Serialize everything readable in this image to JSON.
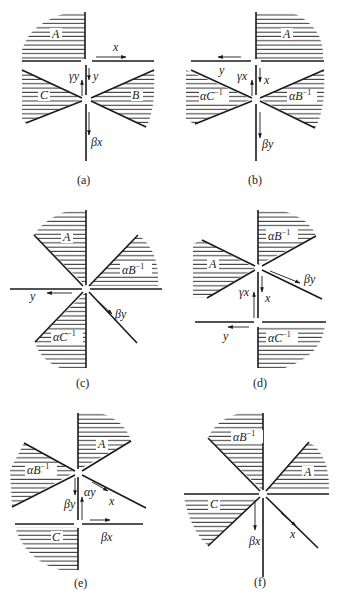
{
  "figure": {
    "panels": [
      {
        "id": "a",
        "caption": "(a)",
        "regions": [
          "A",
          "C",
          "B"
        ],
        "arrows": [
          "x",
          "y",
          "γy",
          "βx"
        ]
      },
      {
        "id": "b",
        "caption": "(b)",
        "regions": [
          "A",
          "αC⁻¹",
          "αB⁻¹"
        ],
        "arrows": [
          "y",
          "γx",
          "x",
          "βy"
        ]
      },
      {
        "id": "c",
        "caption": "(c)",
        "regions": [
          "A",
          "αB⁻¹",
          "αC⁻¹"
        ],
        "arrows": [
          "y",
          "βy"
        ]
      },
      {
        "id": "d",
        "caption": "(d)",
        "regions": [
          "αB⁻¹",
          "A",
          "αC⁻¹"
        ],
        "arrows": [
          "βy",
          "γx",
          "x",
          "y"
        ]
      },
      {
        "id": "e",
        "caption": "(e)",
        "regions": [
          "A",
          "αB⁻¹",
          "C"
        ],
        "arrows": [
          "βy",
          "αy",
          "x",
          "βx"
        ]
      },
      {
        "id": "f",
        "caption": "(f)",
        "regions": [
          "αB⁻¹",
          "A",
          "C"
        ],
        "arrows": [
          "βx",
          "x"
        ]
      }
    ]
  },
  "labels": {
    "a": {
      "A": "A",
      "B": "B",
      "C": "C",
      "x": "x",
      "y": "y",
      "gy": "γy",
      "bx": "βx",
      "cap": "(a)"
    },
    "b": {
      "A": "A",
      "aB": "αB",
      "aC": "αC",
      "sup": "−1",
      "y": "y",
      "gx": "γx",
      "x": "x",
      "by": "βy",
      "cap": "(b)"
    },
    "c": {
      "A": "A",
      "aB": "αB",
      "aC": "αC",
      "sup": "−1",
      "y": "y",
      "by": "βy",
      "cap": "(c)"
    },
    "d": {
      "A": "A",
      "aB": "αB",
      "aC": "αC",
      "sup": "−1",
      "by": "βy",
      "gx": "γx",
      "x": "x",
      "y": "y",
      "cap": "(d)"
    },
    "e": {
      "A": "A",
      "aB": "αB",
      "C": "C",
      "sup": "−1",
      "by": "βy",
      "ay": "αy",
      "x": "x",
      "bx": "βx",
      "cap": "(e)"
    },
    "f": {
      "A": "A",
      "aB": "αB",
      "C": "C",
      "sup": "−1",
      "bx": "βx",
      "x": "x",
      "cap": "(f)"
    }
  },
  "colors": {
    "ink": "#1a1a1a",
    "background": "#ffffff"
  }
}
